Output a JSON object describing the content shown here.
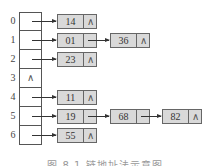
{
  "diagram": {
    "type": "hash-table-separate-chaining",
    "null_symbol": "∧",
    "slots": [
      {
        "index": "0",
        "chain": [
          "14"
        ]
      },
      {
        "index": "1",
        "chain": [
          "01",
          "36"
        ]
      },
      {
        "index": "2",
        "chain": [
          "23"
        ]
      },
      {
        "index": "3",
        "chain": []
      },
      {
        "index": "4",
        "chain": [
          "11"
        ]
      },
      {
        "index": "5",
        "chain": [
          "19",
          "68",
          "82"
        ]
      },
      {
        "index": "6",
        "chain": [
          "55"
        ]
      }
    ],
    "caption": "图 8.1  链地址法示意图"
  }
}
